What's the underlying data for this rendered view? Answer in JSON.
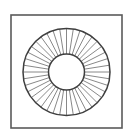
{
  "diagram": {
    "type": "annular-ring-with-radial-spokes",
    "frame": {
      "x": 11,
      "y": 15,
      "width": 111,
      "height": 113,
      "stroke": "#5a5a5a",
      "stroke_width": 1.6
    },
    "ring": {
      "center_x": 66.5,
      "center_y": 72,
      "outer_radius": 43.5,
      "inner_radius": 18,
      "outer_stroke": "#3f3f3f",
      "inner_stroke": "#3f3f3f",
      "circle_stroke_width": 1.5,
      "spoke_count": 40,
      "spoke_stroke": "#7a7a7a",
      "spoke_stroke_width": 0.9
    },
    "background": "#ffffff"
  }
}
